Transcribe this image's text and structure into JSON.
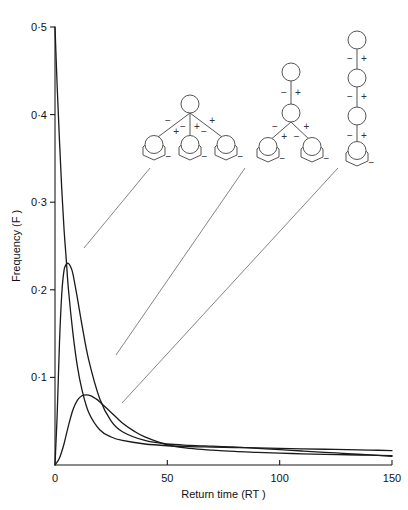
{
  "figure": {
    "background": "#ffffff",
    "ink": "#1a1a1a"
  },
  "chart_data": {
    "type": "line",
    "title": "",
    "xlabel": "Return time (RT )",
    "ylabel": "Frequency (F )",
    "xlim": [
      0,
      150
    ],
    "ylim": [
      0,
      0.5
    ],
    "xticks": [
      0,
      50,
      100,
      150
    ],
    "xticklabels": [
      "0",
      "50",
      "100",
      "150"
    ],
    "yticks": [
      0.1,
      0.2,
      0.3,
      0.4,
      0.5
    ],
    "yticklabels": [
      "0·1",
      "0·2",
      "0·3",
      "0·4",
      "0·5"
    ],
    "grid": false,
    "legend": "none",
    "series": [
      {
        "name": "curve-1",
        "note": "narrow spike peaking at F = 0.5 at RT = 0, decaying to a long flat tail",
        "x": [
          0,
          1,
          2,
          3,
          4,
          5,
          6,
          8,
          10,
          12,
          15,
          20,
          25,
          30,
          40,
          50,
          60,
          70,
          80,
          90,
          100,
          110,
          120,
          130,
          140,
          150
        ],
        "y": [
          0.5,
          0.43,
          0.37,
          0.315,
          0.27,
          0.235,
          0.2,
          0.15,
          0.112,
          0.086,
          0.06,
          0.04,
          0.032,
          0.028,
          0.024,
          0.022,
          0.021,
          0.0205,
          0.02,
          0.0195,
          0.019,
          0.0185,
          0.018,
          0.0175,
          0.017,
          0.0165
        ]
      },
      {
        "name": "curve-2",
        "note": "peaks at F ≈ 0.23 near RT ≈ 6, then falls and crosses curve-1 near RT ≈ 90",
        "x": [
          0,
          1,
          2,
          3,
          4,
          5,
          6,
          7,
          8,
          10,
          12,
          15,
          20,
          25,
          30,
          40,
          50,
          60,
          70,
          80,
          90,
          100,
          110,
          120,
          130,
          140,
          150
        ],
        "y": [
          0.0,
          0.06,
          0.14,
          0.195,
          0.222,
          0.229,
          0.23,
          0.226,
          0.218,
          0.19,
          0.16,
          0.12,
          0.075,
          0.05,
          0.038,
          0.028,
          0.024,
          0.0225,
          0.0215,
          0.0205,
          0.019,
          0.0175,
          0.016,
          0.0145,
          0.013,
          0.0115,
          0.01
        ]
      },
      {
        "name": "curve-3",
        "note": "low broad peak at F ≈ 0.08 near RT ≈ 14, long shallow tail converging with the others",
        "x": [
          0,
          2,
          4,
          6,
          8,
          10,
          12,
          14,
          16,
          18,
          20,
          25,
          30,
          35,
          40,
          50,
          60,
          70,
          80,
          90,
          100,
          110,
          120,
          130,
          140,
          150
        ],
        "y": [
          0.0,
          0.008,
          0.024,
          0.045,
          0.063,
          0.074,
          0.079,
          0.08,
          0.079,
          0.076,
          0.072,
          0.06,
          0.048,
          0.039,
          0.032,
          0.023,
          0.019,
          0.017,
          0.0155,
          0.0145,
          0.0135,
          0.0128,
          0.0122,
          0.0117,
          0.0112,
          0.0108
        ]
      }
    ],
    "annotations": [
      {
        "name": "diagram-1",
        "label": "shallow-broad-hierarchy",
        "description": "root circle with three leaf nodes, signed links",
        "leader_from": [
          150,
          168
        ],
        "leader_to": [
          84,
          248
        ],
        "root_signs": [
          "−",
          "+",
          "−",
          "+",
          "−",
          "+"
        ],
        "leaf_sign": "−",
        "leaf_count": 3,
        "depth": 2
      },
      {
        "name": "diagram-2",
        "label": "intermediate-hierarchy",
        "description": "chain of two circles then two leaf nodes, signed links",
        "leader_from": [
          245,
          168
        ],
        "leader_to": [
          116,
          355
        ],
        "root_signs": [
          "−",
          "+",
          "−",
          "+",
          "−",
          "+"
        ],
        "leaf_sign": "−",
        "leaf_count": 2,
        "depth": 3
      },
      {
        "name": "diagram-3",
        "label": "deep-narrow-hierarchy",
        "description": "linear chain of four nodes, signed links",
        "leader_from": [
          338,
          168
        ],
        "leader_to": [
          122,
          403
        ],
        "root_signs": [
          "−",
          "+",
          "−",
          "+",
          "−",
          "+"
        ],
        "leaf_sign": "−",
        "leaf_count": 1,
        "depth": 4
      }
    ]
  },
  "signs": {
    "minus": "−",
    "plus": "+"
  }
}
